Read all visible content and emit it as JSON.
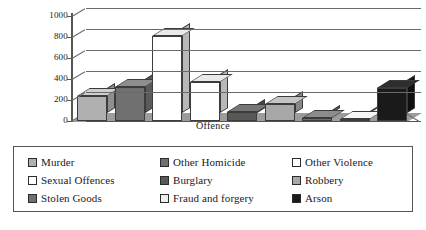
{
  "chart_data": {
    "type": "bar",
    "title": "",
    "xlabel": "Offence",
    "ylabel": "",
    "ylim": [
      0,
      1000
    ],
    "yticks": [
      "0",
      "200",
      "400",
      "600",
      "800",
      "1000"
    ],
    "grid": true,
    "legend_position": "bottom",
    "style": "3d-bar",
    "categories": [
      "Murder",
      "Other Homicide",
      "Other Violence",
      "Sexual Offences",
      "Burglary",
      "Robbery",
      "Stolen Goods",
      "Fraud and forgery",
      "Arson"
    ],
    "values": [
      240,
      320,
      810,
      370,
      90,
      160,
      30,
      10,
      310
    ],
    "colors": [
      "#b0b0b0",
      "#707070",
      "#ffffff",
      "#ffffff",
      "#585858",
      "#a8a8a8",
      "#6e6e6e",
      "#efefef",
      "#1a1a1a"
    ],
    "top_colors": [
      "#cfcfcf",
      "#8e8e8e",
      "#e9e9e9",
      "#e9e9e9",
      "#767676",
      "#c4c4c4",
      "#8c8c8c",
      "#f7f7f7",
      "#2e2e2e"
    ],
    "side_colors": [
      "#8f8f8f",
      "#5a5a5a",
      "#b8b8b8",
      "#b8b8b8",
      "#444444",
      "#878787",
      "#565656",
      "#cccccc",
      "#101010"
    ]
  },
  "legend": {
    "items": [
      {
        "label": "Murder",
        "color": "#b0b0b0"
      },
      {
        "label": "Other Homicide",
        "color": "#707070"
      },
      {
        "label": "Other Violence",
        "color": "#ffffff"
      },
      {
        "label": "Sexual Offences",
        "color": "#ffffff"
      },
      {
        "label": "Burglary",
        "color": "#585858"
      },
      {
        "label": "Robbery",
        "color": "#a8a8a8"
      },
      {
        "label": "Stolen Goods",
        "color": "#6e6e6e"
      },
      {
        "label": "Fraud and forgery",
        "color": "#efefef"
      },
      {
        "label": "Arson",
        "color": "#1a1a1a"
      }
    ]
  }
}
